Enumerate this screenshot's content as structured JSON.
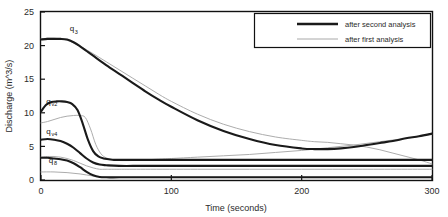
{
  "chart_data": {
    "type": "line",
    "title": "",
    "xlabel": "Time (seconds)",
    "ylabel": "Discharge (m^3/s)",
    "xlim": [
      0,
      300
    ],
    "ylim": [
      0,
      25
    ],
    "xticks": [
      0,
      100,
      200,
      300
    ],
    "yticks": [
      0,
      5,
      10,
      15,
      20,
      25
    ],
    "grid": false,
    "legend_position": "top-right",
    "legend": [
      {
        "name": "after second analysis",
        "style": "thick-dark",
        "color": "#1a1a1a"
      },
      {
        "name": "after first analysis",
        "style": "thin-light",
        "color": "#a8a8a8"
      }
    ],
    "annotations": [
      {
        "text": "q",
        "sub": "3",
        "x": 22,
        "y": 22.1
      },
      {
        "text": "q",
        "sub": "v2",
        "x": 4,
        "y": 11.3
      },
      {
        "text": "q",
        "sub": "v4",
        "x": 4,
        "y": 6.9
      },
      {
        "text": "q",
        "sub": "8",
        "x": 6,
        "y": 2.5
      }
    ],
    "series": [
      {
        "name": "q3 after second analysis",
        "legend_group": "after second analysis",
        "x": [
          0,
          5,
          10,
          15,
          20,
          25,
          30,
          35,
          40,
          50,
          60,
          70,
          80,
          90,
          100,
          120,
          140,
          160,
          180,
          200,
          210,
          220,
          230,
          240,
          250,
          260,
          270,
          280,
          290,
          300
        ],
        "y": [
          20.9,
          21.0,
          21.0,
          21.0,
          20.9,
          20.5,
          19.9,
          19.2,
          18.5,
          17.1,
          15.8,
          14.5,
          13.2,
          12.0,
          10.9,
          8.9,
          7.3,
          6.1,
          5.2,
          4.7,
          4.6,
          4.6,
          4.7,
          4.9,
          5.2,
          5.5,
          5.8,
          6.2,
          6.5,
          6.9
        ]
      },
      {
        "name": "q3 after first analysis",
        "legend_group": "after first analysis",
        "x": [
          0,
          5,
          10,
          15,
          20,
          25,
          30,
          40,
          50,
          60,
          70,
          80,
          90,
          100,
          120,
          140,
          160,
          180,
          200,
          210,
          220,
          230,
          240,
          250,
          260,
          270,
          280,
          290,
          300
        ],
        "y": [
          21.0,
          21.1,
          21.1,
          21.0,
          20.8,
          20.4,
          19.9,
          18.8,
          17.6,
          16.4,
          15.2,
          14.0,
          12.8,
          11.7,
          9.8,
          8.3,
          7.2,
          6.4,
          5.9,
          5.7,
          5.6,
          5.4,
          5.2,
          4.9,
          4.5,
          4.0,
          3.5,
          3.0,
          2.4
        ]
      },
      {
        "name": "qv2 after second analysis",
        "legend_group": "after second analysis",
        "x": [
          0,
          4,
          8,
          12,
          16,
          20,
          24,
          28,
          32,
          36,
          40,
          44,
          48,
          52,
          56,
          60,
          70,
          80,
          100,
          140,
          180,
          220,
          260,
          300
        ],
        "y": [
          10.2,
          11.2,
          11.6,
          11.7,
          11.7,
          11.6,
          11.3,
          10.4,
          8.4,
          6.0,
          4.3,
          3.5,
          3.2,
          3.1,
          3.0,
          3.0,
          3.0,
          3.0,
          3.0,
          3.0,
          3.0,
          3.0,
          3.0,
          3.0
        ]
      },
      {
        "name": "qv2 after first analysis",
        "legend_group": "after first analysis",
        "x": [
          0,
          5,
          10,
          15,
          20,
          25,
          30,
          34,
          38,
          42,
          46,
          50,
          55,
          60,
          70,
          80,
          90,
          100,
          120,
          140,
          160,
          180,
          200,
          220,
          240,
          260,
          280,
          300
        ],
        "y": [
          8.5,
          8.7,
          9.0,
          9.3,
          9.5,
          9.6,
          9.6,
          9.3,
          7.6,
          5.3,
          3.9,
          3.3,
          3.0,
          2.9,
          2.9,
          3.0,
          3.1,
          3.2,
          3.4,
          3.6,
          3.8,
          4.1,
          4.4,
          4.8,
          5.2,
          5.7,
          6.2,
          6.8
        ]
      },
      {
        "name": "qv4 after second analysis",
        "legend_group": "after second analysis",
        "x": [
          0,
          5,
          10,
          15,
          20,
          25,
          30,
          35,
          40,
          45,
          50,
          60,
          80,
          120,
          160,
          200,
          240,
          300
        ],
        "y": [
          6.0,
          6.1,
          6.0,
          5.8,
          5.4,
          4.8,
          4.0,
          3.2,
          2.6,
          2.3,
          2.2,
          2.1,
          2.1,
          2.1,
          2.1,
          2.1,
          2.1,
          2.1
        ]
      },
      {
        "name": "qv4 after first analysis",
        "legend_group": "after first analysis",
        "x": [
          0,
          5,
          10,
          15,
          20,
          25,
          30,
          35,
          40,
          45,
          50,
          60,
          80,
          120,
          160,
          200,
          240,
          300
        ],
        "y": [
          3.4,
          3.5,
          3.5,
          3.4,
          3.2,
          2.9,
          2.5,
          2.1,
          1.8,
          1.6,
          1.6,
          1.6,
          1.6,
          1.6,
          1.6,
          1.6,
          1.6,
          1.6
        ]
      },
      {
        "name": "q8 after second analysis",
        "legend_group": "after second analysis",
        "x": [
          0,
          5,
          10,
          15,
          20,
          25,
          30,
          35,
          40,
          45,
          50,
          60,
          80,
          120,
          160,
          200,
          240,
          300
        ],
        "y": [
          3.3,
          3.3,
          3.2,
          3.1,
          2.9,
          2.5,
          1.9,
          1.2,
          0.7,
          0.45,
          0.4,
          0.4,
          0.4,
          0.4,
          0.4,
          0.4,
          0.4,
          0.4
        ]
      },
      {
        "name": "q8 after first analysis",
        "legend_group": "after first analysis",
        "x": [
          0,
          10,
          20,
          30,
          40,
          50,
          60,
          80,
          120,
          160,
          200,
          240,
          300
        ],
        "y": [
          1.2,
          1.2,
          1.1,
          0.9,
          0.6,
          0.45,
          0.4,
          0.4,
          0.4,
          0.4,
          0.4,
          0.4,
          0.4
        ]
      }
    ]
  },
  "axes": {
    "ylabel": "Discharge (m^3/s)",
    "xlabel": "Time (seconds)",
    "ytick_labels": [
      "0",
      "5",
      "10",
      "15",
      "20",
      "25"
    ],
    "xtick_labels": [
      "0",
      "100",
      "200",
      "300"
    ]
  },
  "legend": {
    "entry_1": "after second analysis",
    "entry_2": "after first analysis"
  },
  "labels": {
    "q3_base": "q",
    "q3_sub": "3",
    "qv2_base": "q",
    "qv2_sub": "v2",
    "qv4_base": "q",
    "qv4_sub": "v4",
    "q8_base": "q",
    "q8_sub": "8"
  },
  "colors": {
    "dark_line": "#1a1a1a",
    "light_line": "#a8a8a8",
    "axis": "#111111",
    "background": "#ffffff"
  }
}
